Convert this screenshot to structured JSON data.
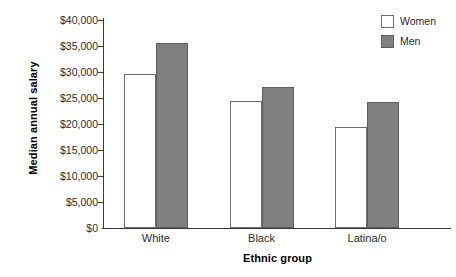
{
  "chart_data": {
    "type": "bar",
    "title": "",
    "xlabel": "Ethnic group",
    "ylabel": "Median annual salary",
    "categories": [
      "White",
      "Black",
      "Latina/o"
    ],
    "series": [
      {
        "name": "Women",
        "values": [
          29700,
          24500,
          19500
        ],
        "color": "#ffffff",
        "edge_color": "#6e6e6e"
      },
      {
        "name": "Men",
        "values": [
          35500,
          27200,
          24200
        ],
        "color": "#808080",
        "edge_color": "#5e5e5e"
      }
    ],
    "ylim": [
      0,
      40000
    ],
    "ytick_values": [
      0,
      5000,
      10000,
      15000,
      20000,
      25000,
      30000,
      35000,
      40000
    ],
    "ytick_labels": [
      "$0",
      "$5,000",
      "$10,000",
      "$15,000",
      "$20,000",
      "$25,000",
      "$30,000",
      "$35,000",
      "$40,000"
    ],
    "grid": false,
    "legend_position": "top-right",
    "legend_entries": [
      "Women",
      "Men"
    ]
  },
  "axes": {
    "y_title": "Median annual salary",
    "x_title": "Ethnic group"
  }
}
